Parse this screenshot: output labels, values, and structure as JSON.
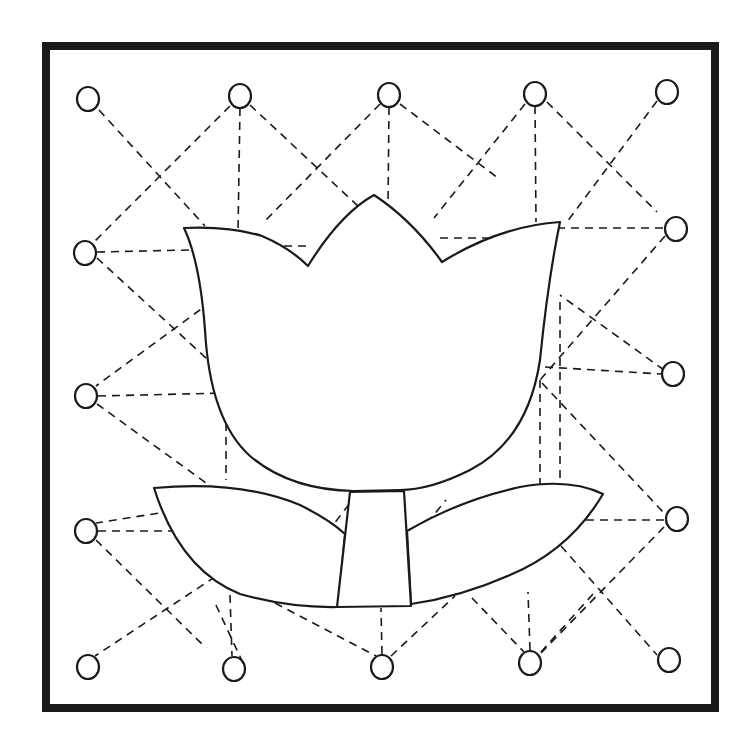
{
  "colors": {
    "ink": "#1a1a1a",
    "paper": "#ffffff"
  },
  "frame": {
    "x": 46,
    "y": 46,
    "width": 669,
    "height": 662
  },
  "dots": [
    {
      "x": 88,
      "y": 99
    },
    {
      "x": 240,
      "y": 96
    },
    {
      "x": 389,
      "y": 95
    },
    {
      "x": 535,
      "y": 94
    },
    {
      "x": 667,
      "y": 92
    },
    {
      "x": 85,
      "y": 253
    },
    {
      "x": 86,
      "y": 396
    },
    {
      "x": 86,
      "y": 531
    },
    {
      "x": 88,
      "y": 667
    },
    {
      "x": 676,
      "y": 229
    },
    {
      "x": 673,
      "y": 374
    },
    {
      "x": 677,
      "y": 519
    },
    {
      "x": 669,
      "y": 660
    },
    {
      "x": 234,
      "y": 669
    },
    {
      "x": 382,
      "y": 667
    },
    {
      "x": 530,
      "y": 663
    }
  ],
  "dashed_lines": [
    [
      99,
      110,
      205,
      226
    ],
    [
      230,
      106,
      94,
      242
    ],
    [
      240,
      108,
      238,
      232
    ],
    [
      250,
      105,
      360,
      208
    ],
    [
      380,
      104,
      264,
      222
    ],
    [
      389,
      107,
      388,
      207
    ],
    [
      400,
      104,
      498,
      178
    ],
    [
      525,
      104,
      434,
      218
    ],
    [
      535,
      106,
      536,
      222
    ],
    [
      547,
      102,
      657,
      212
    ],
    [
      657,
      101,
      567,
      222
    ],
    [
      97,
      252,
      190,
      250
    ],
    [
      97,
      258,
      230,
      380
    ],
    [
      223,
      293,
      96,
      386
    ],
    [
      98,
      396,
      226,
      393
    ],
    [
      97,
      404,
      224,
      496
    ],
    [
      172,
      511,
      96,
      523
    ],
    [
      98,
      531,
      198,
      531
    ],
    [
      96,
      540,
      206,
      648
    ],
    [
      227,
      569,
      95,
      656
    ],
    [
      226,
      395,
      226,
      480
    ],
    [
      230,
      595,
      232,
      656
    ],
    [
      243,
      663,
      215,
      603
    ],
    [
      275,
      603,
      376,
      656
    ],
    [
      382,
      654,
      381,
      608
    ],
    [
      391,
      656,
      455,
      596
    ],
    [
      472,
      598,
      524,
      652
    ],
    [
      530,
      650,
      528,
      592
    ],
    [
      541,
      652,
      593,
      594
    ],
    [
      663,
      228,
      557,
      228
    ],
    [
      665,
      236,
      540,
      380
    ],
    [
      545,
      367,
      662,
      374
    ],
    [
      542,
      383,
      663,
      512
    ],
    [
      664,
      520,
      585,
      520
    ],
    [
      664,
      527,
      540,
      654
    ],
    [
      561,
      546,
      657,
      655
    ],
    [
      664,
      370,
      560,
      295
    ],
    [
      560,
      302,
      560,
      480
    ],
    [
      540,
      380,
      540,
      484
    ],
    [
      270,
      246,
      310,
      246
    ],
    [
      440,
      238,
      492,
      238
    ],
    [
      310,
      555,
      360,
      490
    ],
    [
      418,
      534,
      446,
      500
    ]
  ],
  "tulip": {
    "flower_path": "M184 228 Q230 226 262 236 Q290 248 308 266 Q340 214 374 195 Q412 220 442 262 Q500 226 560 222 Q548 280 540 360 Q528 440 470 470 Q430 490 400 490 L354 491 Q290 490 250 456 Q210 420 205 330 Q200 262 184 228 Z",
    "left_leaf_path": "M154 488 Q240 480 300 505 Q330 520 345 534 L338 607 Q290 608 240 594 Q180 570 154 488 Z",
    "right_leaf_path": "M407 531 Q460 500 520 487 Q570 478 603 494 Q570 550 510 575 Q460 597 411 604 Z",
    "stem_path": "M350 492 L404 491 L411 606 L337 607 Z"
  }
}
